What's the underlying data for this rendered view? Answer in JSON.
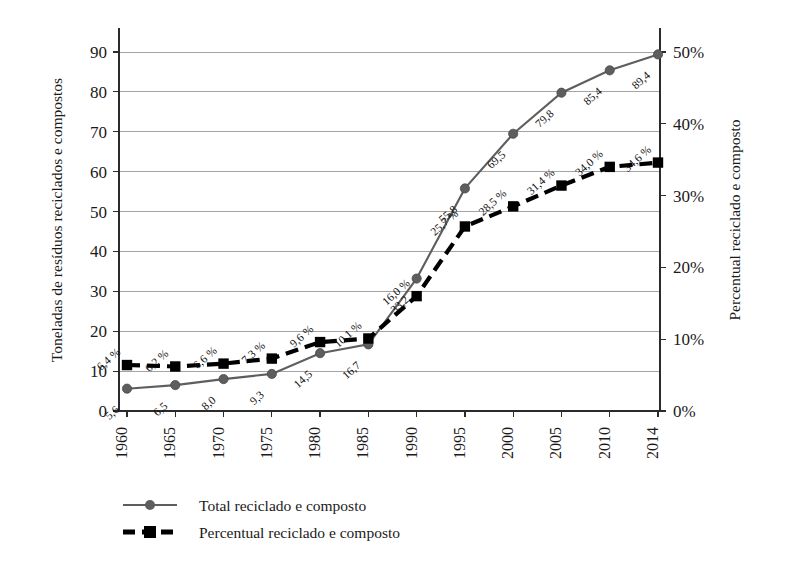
{
  "chart_data": {
    "type": "line",
    "title": "",
    "subtitle": "",
    "xlabel": "",
    "ylabel": "Toneladas de resíduos reciclados e compostos",
    "y2label": "Percentual reciclado e composto",
    "categories": [
      "1960",
      "1965",
      "1970",
      "1975",
      "1980",
      "1985",
      "1990",
      "1995",
      "2000",
      "2005",
      "2010",
      "2014"
    ],
    "ylim": [
      0,
      90
    ],
    "yticks": [
      "0",
      "10",
      "20",
      "30",
      "40",
      "50",
      "60",
      "70",
      "80",
      "90"
    ],
    "y2lim": [
      0,
      50
    ],
    "y2ticks": [
      "0%",
      "10%",
      "20%",
      "30%",
      "40%",
      "50%"
    ],
    "grid": true,
    "legend_position": "bottom-left",
    "series": [
      {
        "name": "Total reciclado e composto",
        "axis": "left",
        "style": "solid",
        "marker": "circle",
        "color": "#5e5e5e",
        "values": [
          5.6,
          6.5,
          8.0,
          9.3,
          14.5,
          16.7,
          33.2,
          55.8,
          69.5,
          79.8,
          85.4,
          89.4
        ],
        "labels": [
          "5,6",
          "6,5",
          "8,0",
          "9,3",
          "14,5",
          "16,7",
          "33,2",
          "55,8",
          "69,5",
          "79,8",
          "85,4",
          "89,4"
        ]
      },
      {
        "name": "Percentual reciclado e composto",
        "axis": "right",
        "style": "dashed",
        "marker": "square",
        "color": "#000000",
        "values": [
          6.4,
          6.2,
          6.6,
          7.3,
          9.6,
          10.1,
          16.0,
          25.7,
          28.5,
          31.4,
          34.0,
          34.6
        ],
        "labels": [
          "6,4 %",
          "6,2 %",
          "6,6 %",
          "7,3 %",
          "9,6 %",
          "10,1 %",
          "16,0 %",
          "25,7 %",
          "28,5 %",
          "31,4 %",
          "34,0 %",
          "34,6 %"
        ]
      }
    ]
  },
  "legend": {
    "items": [
      {
        "label": "Total reciclado e composto",
        "marker": "circle",
        "style": "solid",
        "color": "#5e5e5e"
      },
      {
        "label": "Percentual reciclado e composto",
        "marker": "square",
        "style": "dashed",
        "color": "#000000"
      }
    ]
  },
  "axes": {
    "left_title": "Toneladas de resíduos reciclados e compostos",
    "right_title": "Percentual reciclado e composto"
  }
}
